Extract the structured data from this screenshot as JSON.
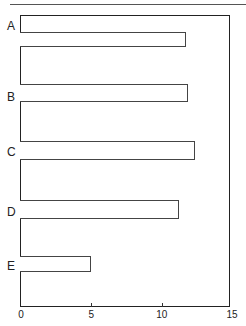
{
  "chart_data": {
    "type": "bar",
    "orientation": "horizontal",
    "title": "",
    "xlabel": "",
    "ylabel": "",
    "categories": [
      "A",
      "B",
      "C",
      "D",
      "E"
    ],
    "values": [
      11.7,
      11.9,
      12.4,
      11.2,
      5.0
    ],
    "xlim": [
      0,
      15
    ],
    "xticks": [
      0,
      5,
      10,
      15
    ],
    "xtick_labels": [
      "0",
      "5",
      "10",
      "15"
    ],
    "grid": false,
    "legend": null,
    "bar_fill": "#ffffff",
    "bar_edge": "#444444"
  },
  "layout": {
    "plot_left_px": 21,
    "px_per_unit": 14.07,
    "bars_y": [
      [
        32,
        47
      ],
      [
        84,
        102
      ],
      [
        141,
        160
      ],
      [
        200,
        219
      ],
      [
        256,
        272
      ]
    ],
    "labels_y": [
      20,
      91,
      146,
      206,
      260
    ]
  }
}
